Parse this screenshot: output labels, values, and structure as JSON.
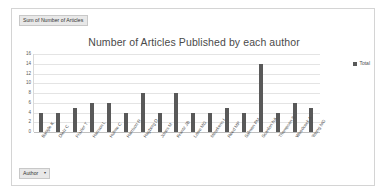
{
  "pivot": {
    "field_header": "Sum of Number of Articles",
    "filter_button": {
      "label": "Author",
      "caret": "▾"
    }
  },
  "legend": {
    "position": "right",
    "entries": [
      {
        "label": "Total",
        "color": "#595959"
      }
    ]
  },
  "chart_data": {
    "type": "bar",
    "title": "Number of Articles Published by each author",
    "xlabel": "",
    "ylabel": "",
    "ylim": [
      0,
      16
    ],
    "yticks": [
      0,
      2,
      4,
      6,
      8,
      10,
      12,
      14,
      16
    ],
    "grid": true,
    "bar_color": "#595959",
    "categories": [
      "Bangle K",
      "Dietz C",
      "Frazier T",
      "Hanson L",
      "Hulme C",
      "Harrison R",
      "Hagberg D",
      "Jones M",
      "Krantz JB",
      "Lowe MG",
      "Meurkens I",
      "Reed MP",
      "Salmon PM",
      "Scanlon NA",
      "Thompson S",
      "Woodcock A",
      "Young MG"
    ],
    "series": [
      {
        "name": "Total",
        "values": [
          4,
          4,
          5,
          6,
          6,
          4,
          8,
          4,
          8,
          4,
          4,
          5,
          4,
          14,
          4,
          6,
          5
        ]
      }
    ]
  }
}
